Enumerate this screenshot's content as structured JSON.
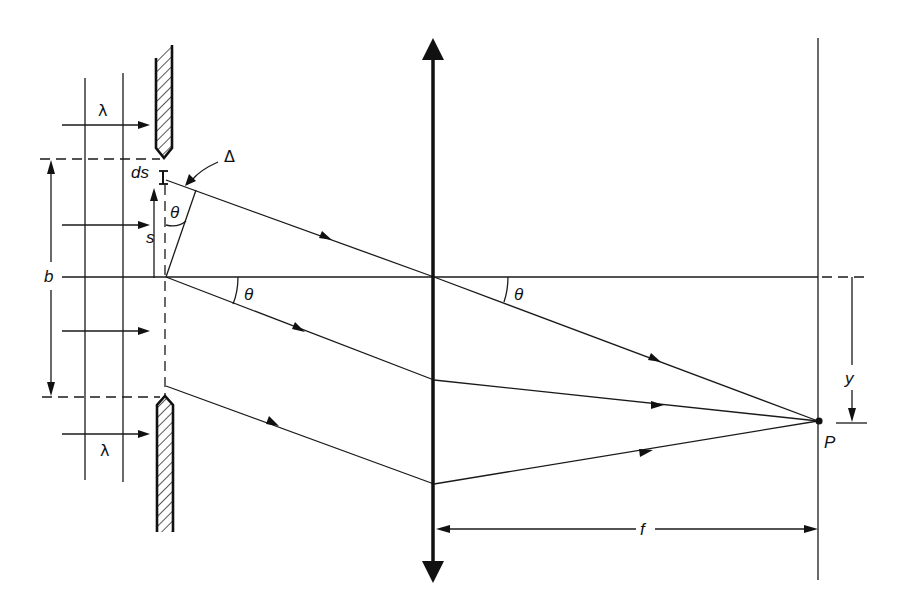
{
  "figure": {
    "labels": {
      "wavelength_top": "λ",
      "wavelength_bottom": "λ",
      "slit_width": "b",
      "element_width": "ds",
      "element_position": "s",
      "path_difference": "Δ",
      "angle_element": "θ",
      "angle_slit": "θ",
      "angle_lens": "θ",
      "screen_offset": "y",
      "observation_point": "P",
      "focal_length": "f"
    },
    "components": {
      "incident_wavefronts": 2,
      "incident_arrows": 4,
      "slit_barriers": 2,
      "lens": "thin converging lens (double-headed arrow)",
      "screen": "vertical line at focal plane",
      "rays": 4
    },
    "colors": {
      "ink": "#111111",
      "background": "#ffffff"
    }
  }
}
